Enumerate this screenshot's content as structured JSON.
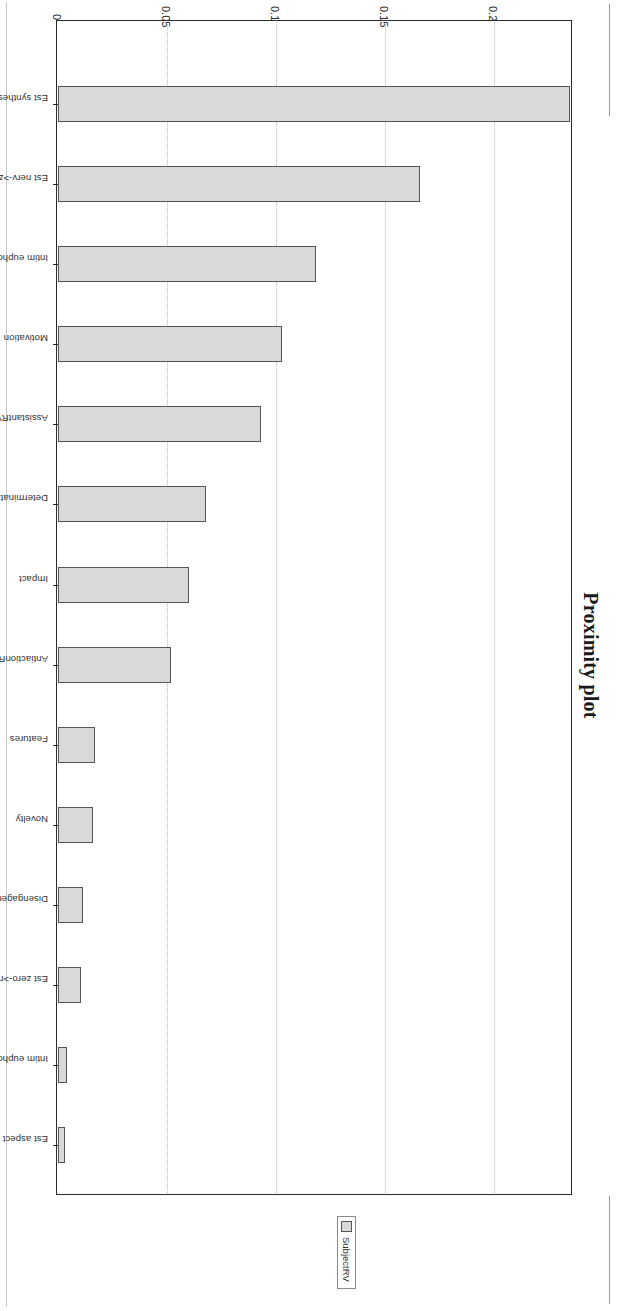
{
  "figure": {
    "title": "Proximity plot"
  },
  "legend": {
    "position": "right",
    "swatch_color": "#d9d9d9",
    "entries": [
      {
        "label": "SubjectRV"
      }
    ]
  },
  "axis": {
    "value_ticks": [
      "0",
      "0.05",
      "0.1",
      "0.15",
      "0.2"
    ],
    "grid": true
  },
  "style": {
    "bar_fill": "#d9d9d9",
    "bar_border": "#555555",
    "frame_border": "#2b2b2b",
    "gridline_color": "#b9b9c4",
    "text_color": "#2f2f2f",
    "background": "#ffffff"
  },
  "chart_data": {
    "type": "bar",
    "title": "Proximity plot",
    "xlabel": "",
    "ylabel": "",
    "orientation": "vertical",
    "ylim": [
      0,
      0.235
    ],
    "grid": true,
    "legend_position": "right",
    "categories": [
      "Est synthesis (G)",
      "Est nerv->zero",
      "Intim euphoric- (L)",
      "Motivation",
      "AssistantRV",
      "Determination",
      "Impact",
      "AntiactionRV",
      "Features",
      "Novelty",
      "Disengagement",
      "Est zero->nerv",
      "Intim euphoric- (I)",
      "Est aspect (H)"
    ],
    "series": [
      {
        "name": "SubjectRV",
        "values": [
          0.235,
          0.166,
          0.1185,
          0.103,
          0.093,
          0.068,
          0.06,
          0.052,
          0.017,
          0.016,
          0.0115,
          0.0105,
          0.004,
          0.003
        ]
      }
    ]
  }
}
